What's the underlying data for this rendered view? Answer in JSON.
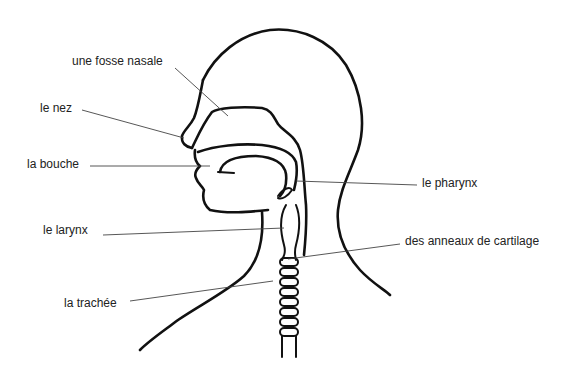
{
  "diagram": {
    "labels": [
      {
        "id": "fosse-nasale",
        "text": "une fosse nasale",
        "x": 72,
        "y": 54
      },
      {
        "id": "nez",
        "text": "le nez",
        "x": 40,
        "y": 101
      },
      {
        "id": "bouche",
        "text": "la bouche",
        "x": 27,
        "y": 157
      },
      {
        "id": "pharynx",
        "text": "le pharynx",
        "x": 422,
        "y": 176
      },
      {
        "id": "larynx",
        "text": "le larynx",
        "x": 43,
        "y": 223
      },
      {
        "id": "anneaux",
        "text": "des anneaux de cartilage",
        "x": 405,
        "y": 234
      },
      {
        "id": "trachee",
        "text": "la trachée",
        "x": 64,
        "y": 296
      }
    ],
    "colors": {
      "line": "#111111",
      "leader": "#444444",
      "background": "#ffffff"
    }
  }
}
